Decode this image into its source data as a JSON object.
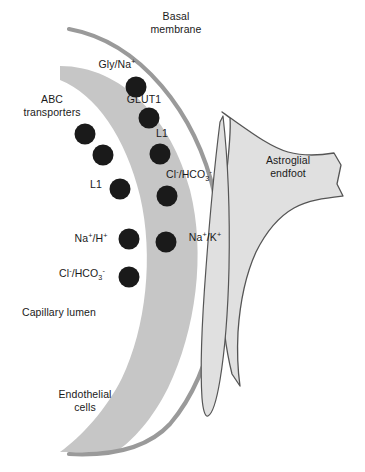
{
  "figure": {
    "background_color": "#ffffff"
  },
  "colors": {
    "endothelial_band": "#c6c6c6",
    "basal_membrane_line": "#9a9a9a",
    "astroglial_fill": "#e0e0e0",
    "astroglial_stroke": "#555555",
    "transporter_dot": "#1a1a1a",
    "text": "#1a1a1a"
  },
  "structures": {
    "basal_membrane": {
      "label_line1": "Basal",
      "label_line2": "membrane"
    },
    "endothelial_cells": {
      "label_line1": "Endothelial",
      "label_line2": "cells"
    },
    "capillary_lumen": {
      "label": "Capillary lumen"
    },
    "astroglial_endfoot": {
      "label_line1": "Astroglial",
      "label_line2": "endfoot"
    }
  },
  "transporters": [
    {
      "id": "gly-na",
      "name": "Gly/Na+",
      "label_html": "Gly/Na<sup>+</sup>",
      "side": "abluminal"
    },
    {
      "id": "glut1",
      "name": "GLUT1",
      "label_html": "GLUT1",
      "side": "abluminal"
    },
    {
      "id": "l1-upper",
      "name": "L1",
      "label_html": "L1",
      "side": "abluminal"
    },
    {
      "id": "cl-hco3-upper",
      "name": "Cl-/HCO3-",
      "label_html": "Cl<sup>-</sup>/HCO<sub>3</sub><sup>-</sup>",
      "side": "abluminal"
    },
    {
      "id": "na-k",
      "name": "Na+/K+",
      "label_html": "Na<sup>+</sup>/K<sup>+</sup>",
      "side": "abluminal"
    },
    {
      "id": "abc",
      "name": "ABC transporters",
      "label_line1": "ABC",
      "label_line2": "transporters",
      "side": "luminal"
    },
    {
      "id": "l1-lower",
      "name": "L1",
      "label_html": "L1",
      "side": "luminal"
    },
    {
      "id": "na-h",
      "name": "Na+/H+",
      "label_html": "Na<sup>+</sup>/H<sup>+</sup>",
      "side": "luminal"
    },
    {
      "id": "cl-hco3-lower",
      "name": "Cl-/HCO3-",
      "label_html": "Cl<sup>-</sup>/HCO<sub>3</sub><sup>-</sup>",
      "side": "luminal"
    }
  ]
}
